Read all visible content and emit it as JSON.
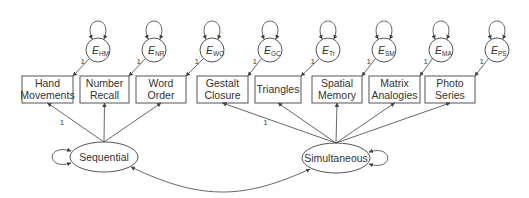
{
  "diagram": {
    "type": "structural-equation-model",
    "observed": [
      {
        "id": "HM",
        "line1": "Hand",
        "line2": "Movements",
        "x": 22,
        "w": 51,
        "error": {
          "sym": "E",
          "sub": "HM",
          "cx": 98
        }
      },
      {
        "id": "NR",
        "line1": "Number",
        "line2": "Recall",
        "x": 80,
        "w": 49,
        "error": {
          "sym": "E",
          "sub": "NR",
          "cx": 154
        }
      },
      {
        "id": "WO",
        "line1": "Word",
        "line2": "Order",
        "x": 136,
        "w": 50,
        "error": {
          "sym": "E",
          "sub": "WO",
          "cx": 212
        }
      },
      {
        "id": "GC",
        "line1": "Gestalt",
        "line2": "Closure",
        "x": 197,
        "w": 51,
        "error": {
          "sym": "E",
          "sub": "GC",
          "cx": 270
        }
      },
      {
        "id": "Tr",
        "line1": "Triangles",
        "line2": "",
        "x": 255,
        "w": 46,
        "error": {
          "sym": "E",
          "sub": "Tr",
          "cx": 328
        }
      },
      {
        "id": "SM",
        "line1": "Spatial",
        "line2": "Memory",
        "x": 312,
        "w": 50,
        "error": {
          "sym": "E",
          "sub": "SM",
          "cx": 384
        }
      },
      {
        "id": "MA",
        "line1": "Matrix",
        "line2": "Analogies",
        "x": 369,
        "w": 51,
        "error": {
          "sym": "E",
          "sub": "MA",
          "cx": 441
        }
      },
      {
        "id": "PS",
        "line1": "Photo",
        "line2": "Series",
        "x": 425,
        "w": 50,
        "error": {
          "sym": "E",
          "sub": "PS",
          "cx": 497
        }
      }
    ],
    "latent": [
      {
        "id": "seq",
        "label": "Sequential",
        "cx": 104,
        "cy": 157,
        "indicators": [
          "HM",
          "NR",
          "WO"
        ],
        "fixed_loading_label": "1"
      },
      {
        "id": "sim",
        "label": "Simultaneous",
        "cx": 336,
        "cy": 158,
        "indicators": [
          "GC",
          "Tr",
          "SM",
          "MA",
          "PS"
        ],
        "fixed_loading_label": "1"
      }
    ],
    "error_path_label": "1",
    "covariance": {
      "from": "seq",
      "to": "sim"
    }
  }
}
